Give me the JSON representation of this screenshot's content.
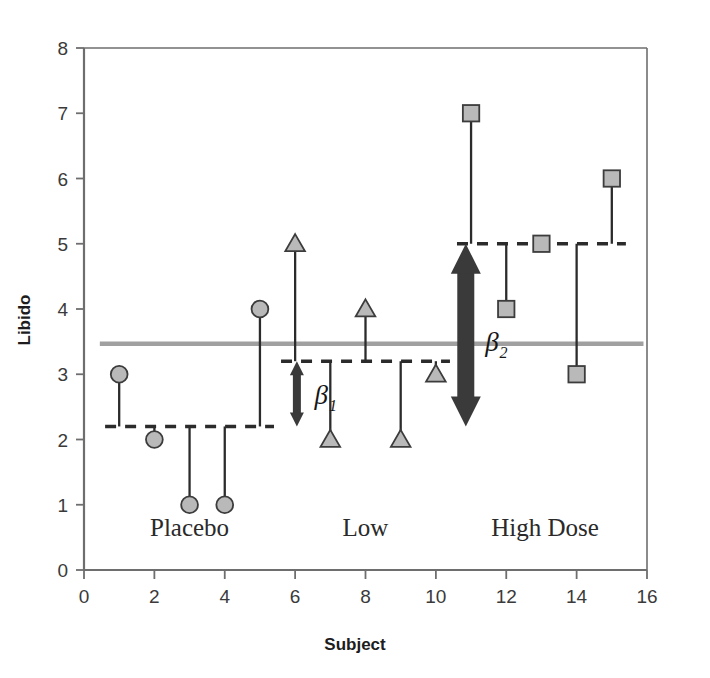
{
  "chart_data": {
    "type": "scatter",
    "title": "",
    "xlabel": "Subject",
    "ylabel": "Libido",
    "xlim": [
      0,
      16
    ],
    "ylim": [
      0,
      8
    ],
    "grid": false,
    "legend": null,
    "x_ticks": [
      "0",
      "2",
      "4",
      "6",
      "8",
      "10",
      "12",
      "14",
      "16"
    ],
    "x_tick_values": [
      0,
      2,
      4,
      6,
      8,
      10,
      12,
      14,
      16
    ],
    "y_ticks": [
      "0",
      "1",
      "2",
      "3",
      "4",
      "5",
      "6",
      "7",
      "8"
    ],
    "y_tick_values": [
      0,
      1,
      2,
      3,
      4,
      5,
      6,
      7,
      8
    ],
    "x": [
      1,
      2,
      3,
      4,
      5,
      6,
      7,
      8,
      9,
      10,
      11,
      12,
      13,
      14,
      15
    ],
    "values": [
      3,
      2,
      1,
      1,
      4,
      5,
      2,
      4,
      2,
      3,
      7,
      4,
      5,
      3,
      6
    ],
    "series": [
      {
        "name": "Placebo",
        "marker": "circle",
        "x": [
          1,
          2,
          3,
          4,
          5
        ],
        "values": [
          3,
          2,
          1,
          1,
          4
        ],
        "group_mean": 2.2,
        "group_mean_x_range": [
          0.6,
          5.4
        ],
        "label": "Placebo",
        "label_x": 3.0
      },
      {
        "name": "Low",
        "marker": "triangle",
        "x": [
          6,
          7,
          8,
          9,
          10
        ],
        "values": [
          5,
          2,
          4,
          2,
          3
        ],
        "group_mean": 3.2,
        "group_mean_x_range": [
          5.6,
          10.4
        ],
        "label": "Low",
        "label_x": 8.0
      },
      {
        "name": "High Dose",
        "marker": "square",
        "x": [
          11,
          12,
          13,
          14,
          15
        ],
        "values": [
          7,
          4,
          5,
          3,
          6
        ],
        "group_mean": 5.0,
        "group_mean_x_range": [
          10.6,
          15.4
        ],
        "label": "High Dose",
        "label_x": 13.1
      }
    ],
    "grand_mean": {
      "value": 3.467,
      "label": "",
      "x_range": [
        0.45,
        15.9
      ]
    },
    "annotations": [
      {
        "name": "beta1",
        "symbol": "β",
        "subscript": "1",
        "x": 6.05,
        "y_from": 2.2,
        "y_to": 3.2,
        "label_x": 6.55,
        "label_y": 2.55
      },
      {
        "name": "beta2",
        "symbol": "β",
        "subscript": "2",
        "x": 10.85,
        "y_from": 2.2,
        "y_to": 5.0,
        "label_x": 11.4,
        "label_y": 3.35
      }
    ]
  },
  "colors": {
    "marker_fill": "#b9b9b9",
    "marker_stroke": "#3c3c3c",
    "stem": "#2b2b2b",
    "group_mean_line": "#2b2b2b",
    "grand_mean_line": "#a0a0a0",
    "axis": "#6e6e6e",
    "arrow": "#3a3a3a",
    "text": "#2a2a2a",
    "background": "#ffffff"
  },
  "axis_titles": {
    "x": "Subject",
    "y": "Libido"
  }
}
